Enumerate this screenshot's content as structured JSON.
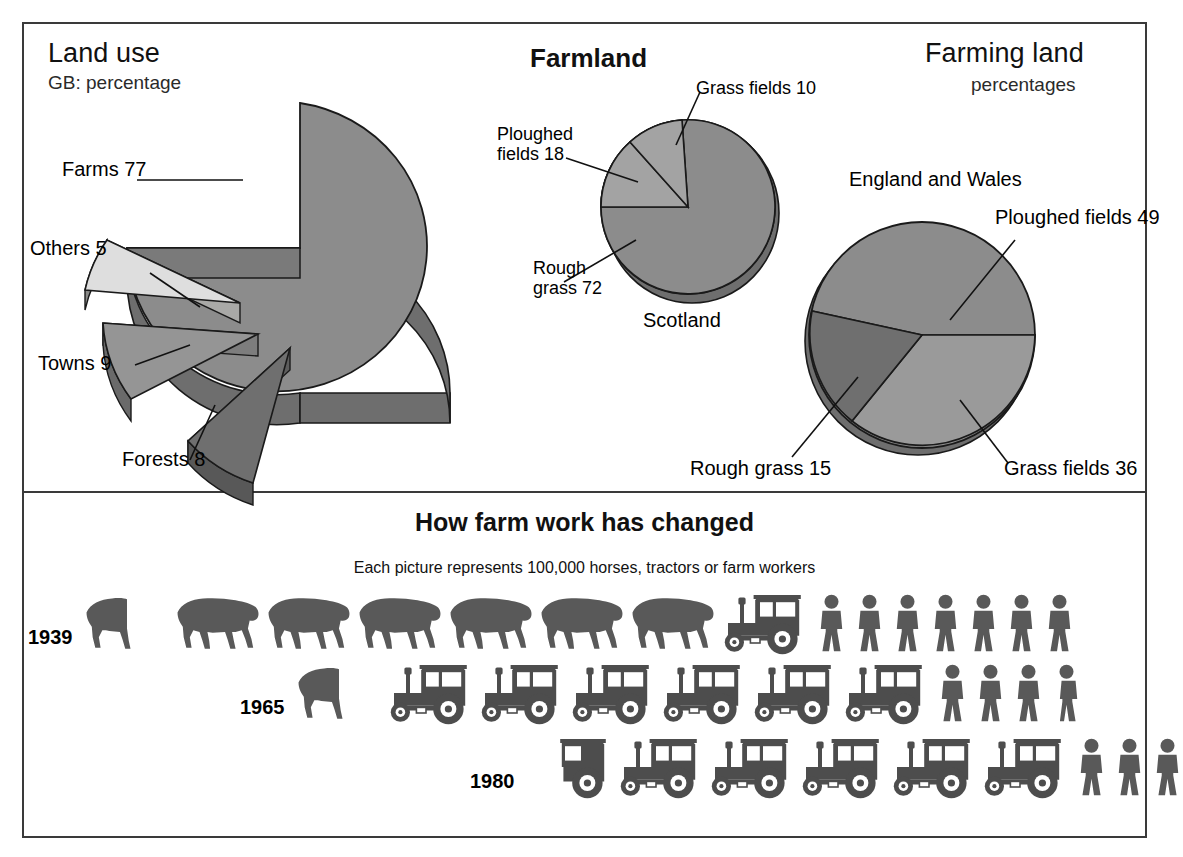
{
  "panels": {
    "top": {
      "left_chart": {
        "title": "Land use",
        "subtitle": "GB: percentage",
        "labels": {
          "farms": "Farms 77",
          "others": "Others 5",
          "towns": "Towns 9",
          "forests": "Forests 8"
        }
      },
      "middle_chart": {
        "title": "Farmland",
        "region": "Scotland",
        "labels": {
          "grass": "Grass fields 10",
          "ploughed": "Ploughed\nfields 18",
          "ploughed_l1": "Ploughed",
          "ploughed_l2": "fields 18",
          "rough_l1": "Rough",
          "rough_l2": "grass 72"
        }
      },
      "right_chart": {
        "title": "Farming land",
        "subtitle": "percentages",
        "region": "England and Wales",
        "labels": {
          "ploughed": "Ploughed fields 49",
          "grass": "Grass fields 36",
          "rough": "Rough grass 15"
        }
      }
    },
    "bottom": {
      "title": "How farm work has changed",
      "subtitle": "Each picture represents 100,000 horses, tractors or farm workers",
      "rows": [
        {
          "year": "1939",
          "horses": 6.5,
          "tractors": 1,
          "workers": 7
        },
        {
          "year": "1965",
          "horses": 0.5,
          "tractors": 6,
          "workers": 3.5
        },
        {
          "year": "1980",
          "horses": 0,
          "tractors": 5.5,
          "workers": 3
        }
      ]
    }
  },
  "colors": {
    "mid_gray": "#8c8c8c",
    "light_gray": "#d8d8d6",
    "dark_gray": "#6e6e6e",
    "darker_gray": "#5a5a5a",
    "outline": "#1a1a1a",
    "frame": "#3a3a3a",
    "icon_gray": "#595959",
    "text": "#111111"
  },
  "chart_data": [
    {
      "type": "pie",
      "id": "land-use-gb",
      "title": "Land use",
      "subtitle": "GB: percentage",
      "unit": "percent",
      "exploded": true,
      "three_d": true,
      "categories": [
        "Farms",
        "Others",
        "Towns",
        "Forests"
      ],
      "values": [
        77,
        5,
        9,
        8
      ],
      "labels": [
        "Farms 77",
        "Others 5",
        "Towns 9",
        "Forests 8"
      ],
      "legend": "callout-labels"
    },
    {
      "type": "pie",
      "id": "farmland-scotland",
      "title": "Farmland",
      "region": "Scotland",
      "unit": "percent",
      "categories": [
        "Rough grass",
        "Ploughed fields",
        "Grass fields"
      ],
      "values": [
        72,
        18,
        10
      ],
      "labels": [
        "Rough grass 72",
        "Ploughed fields 18",
        "Grass fields 10"
      ],
      "legend": "callout-labels"
    },
    {
      "type": "pie",
      "id": "farming-land-england-wales",
      "title": "Farming land",
      "subtitle": "percentages",
      "region": "England and Wales",
      "unit": "percent",
      "categories": [
        "Ploughed fields",
        "Grass fields",
        "Rough grass"
      ],
      "values": [
        49,
        36,
        15
      ],
      "labels": [
        "Ploughed fields 49",
        "Grass fields 36",
        "Rough grass 15"
      ],
      "legend": "callout-labels"
    },
    {
      "type": "pictogram",
      "id": "how-farm-work-has-changed",
      "title": "How farm work has changed",
      "subtitle": "Each picture represents 100,000 horses, tractors or farm workers",
      "unit_value": 100000,
      "categories": [
        "1939",
        "1965",
        "1980"
      ],
      "series": [
        {
          "name": "horses",
          "values": [
            6.5,
            0.5,
            0
          ]
        },
        {
          "name": "tractors",
          "values": [
            1,
            6,
            5.5
          ]
        },
        {
          "name": "workers",
          "values": [
            7,
            3.5,
            3
          ]
        }
      ]
    }
  ]
}
